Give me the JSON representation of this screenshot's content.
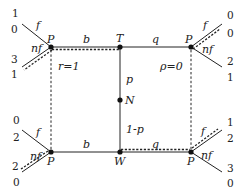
{
  "diagram": {
    "type": "extensive-form game tree",
    "nodes": {
      "top_left": {
        "label": "P"
      },
      "top_middle": {
        "label": "T"
      },
      "top_right": {
        "label": "P"
      },
      "middle": {
        "label": "N"
      },
      "bottom_left": {
        "label": "P"
      },
      "bottom_middle": {
        "label": "W"
      },
      "bottom_right": {
        "label": "P"
      }
    },
    "edges": {
      "top_left_to_T": "b",
      "T_to_top_right": "q",
      "bottom_left_to_W": "b",
      "W_to_bottom_right": "q",
      "N_to_T": "p",
      "N_to_W": "1-p"
    },
    "beliefs": {
      "left": "r=1",
      "right": "ρ=0"
    },
    "actions": {
      "fight": "f",
      "not_fight": "nf"
    },
    "payoffs": {
      "top_left_f": [
        "1",
        "0"
      ],
      "top_left_nf": [
        "3",
        "1"
      ],
      "top_right_f": [
        "0",
        "0"
      ],
      "top_right_nf": [
        "2",
        "1"
      ],
      "bottom_left_f": [
        "0",
        "2"
      ],
      "bottom_left_nf": [
        "2",
        "0"
      ],
      "bottom_right_f": [
        "1",
        "2"
      ],
      "bottom_right_nf": [
        "3",
        "0"
      ]
    }
  }
}
